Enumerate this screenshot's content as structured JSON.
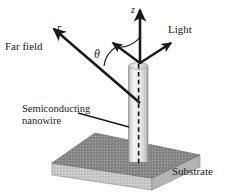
{
  "figure": {
    "background_color": "#ffffff",
    "line_color": "#1a1a1a",
    "labels": {
      "far_field": "Far field",
      "r": "r",
      "theta": "θ",
      "z": "z",
      "light": "Light",
      "semiconducting_nanowire": "Semiconducting\nnanowire",
      "substrate": "Substrate"
    },
    "colors": {
      "arrow": "#1a1a1a",
      "nanowire_light": "#f2f2f2",
      "nanowire_mid": "#d9d9d9",
      "nanowire_edge": "#9a9a9a",
      "substrate_top": "#8d8d8d",
      "substrate_front": "#c9c9c9",
      "dashed_axis": "#111111"
    },
    "geometry": {
      "vertex": [
        140,
        62
      ],
      "z_axis_tip": [
        140,
        8
      ],
      "light_arrow_tip": [
        172,
        42
      ],
      "r_arrow_tip": [
        52,
        28
      ],
      "theta_arrow_tip": [
        112,
        42
      ],
      "nanowire_top": 63,
      "nanowire_bottom": 162,
      "nanowire_left": 128,
      "nanowire_right": 148,
      "substrate_top_face": [
        [
          95,
          133
        ],
        [
          200,
          155
        ],
        [
          152,
          178
        ],
        [
          52,
          163
        ]
      ],
      "substrate_thickness": 12
    },
    "leader_line_semiconducting": [
      [
        78,
        114
      ],
      [
        128,
        127
      ]
    ]
  }
}
